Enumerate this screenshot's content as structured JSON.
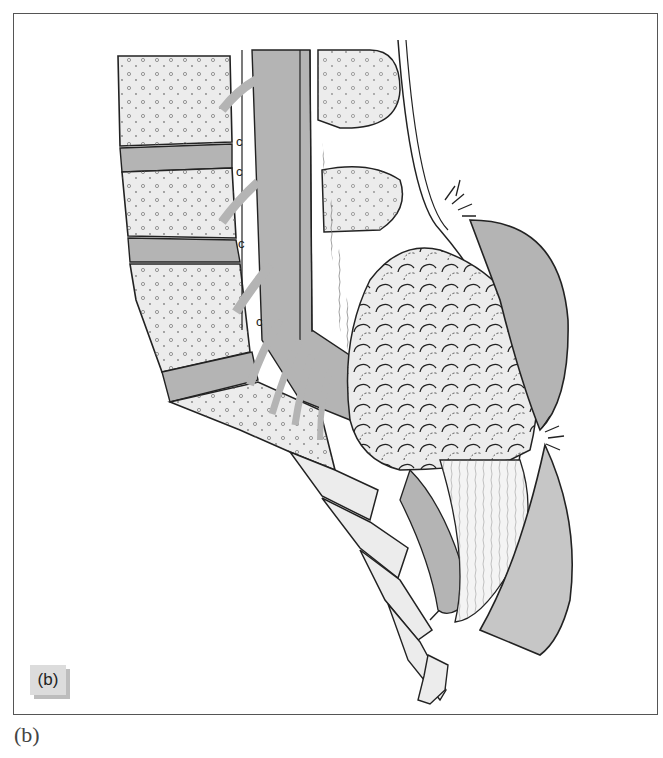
{
  "figure": {
    "panel_label": "(b)",
    "caption": "(b)",
    "colors": {
      "border": "#555555",
      "bone_fill": "#ececec",
      "soft_tissue_fill": "#b4b4b4",
      "outline": "#222222",
      "label_box": "#dcdcdc",
      "label_shadow": "#bdbdbd"
    }
  }
}
